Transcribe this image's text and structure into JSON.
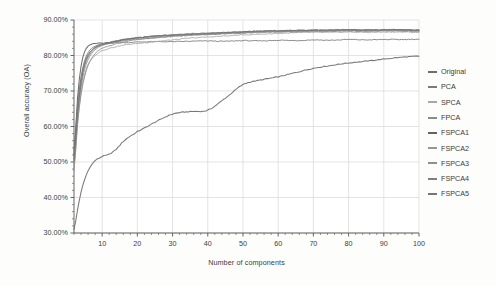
{
  "chart_data": {
    "type": "line",
    "title": "",
    "xlabel": "Number of components",
    "ylabel": "Overall accuracy (OA)",
    "xlim": [
      2,
      100
    ],
    "ylim": [
      30,
      90
    ],
    "xticks": [
      10,
      20,
      30,
      40,
      50,
      60,
      70,
      80,
      90,
      100
    ],
    "yticks": [
      30,
      40,
      50,
      60,
      70,
      80,
      90
    ],
    "ytick_labels": [
      "30.00%",
      "40.00%",
      "50.00%",
      "60.00%",
      "70.00%",
      "80.00%",
      "90.00%"
    ],
    "xtick_labels": [
      "10",
      "20",
      "30",
      "40",
      "50",
      "60",
      "70",
      "80",
      "90",
      "100"
    ],
    "grid": true,
    "legend_position": "right",
    "x": [
      2,
      3,
      4,
      5,
      6,
      7,
      8,
      9,
      10,
      12,
      14,
      16,
      18,
      20,
      25,
      30,
      35,
      40,
      45,
      50,
      55,
      60,
      65,
      70,
      75,
      80,
      85,
      90,
      95,
      100
    ],
    "series": [
      {
        "name": "Original",
        "color": "#6e6e6e",
        "values": [
          31.0,
          36.5,
          41.5,
          45.0,
          47.5,
          49.2,
          50.4,
          51.0,
          51.6,
          52.2,
          53.6,
          55.8,
          57.3,
          58.6,
          61.2,
          63.5,
          64.2,
          64.6,
          68.0,
          71.8,
          73.1,
          74.0,
          75.2,
          76.4,
          77.2,
          77.9,
          78.4,
          79.0,
          79.5,
          79.8
        ]
      },
      {
        "name": "PCA",
        "color": "#7a7a7a",
        "values": [
          53.5,
          66.0,
          74.0,
          78.5,
          80.8,
          82.0,
          82.6,
          83.0,
          83.2,
          83.4,
          83.6,
          83.6,
          83.7,
          83.8,
          83.9,
          83.9,
          84.0,
          84.1,
          84.0,
          84.2,
          84.1,
          84.3,
          84.2,
          84.4,
          84.3,
          84.5,
          84.4,
          84.5,
          84.5,
          84.6
        ]
      },
      {
        "name": "SPCA",
        "color": "#a8a8a8",
        "values": [
          48.0,
          61.0,
          69.5,
          74.5,
          77.5,
          79.0,
          80.0,
          80.8,
          81.4,
          82.0,
          82.5,
          82.9,
          83.2,
          83.4,
          83.9,
          84.4,
          84.9,
          85.2,
          85.5,
          85.8,
          86.0,
          86.2,
          86.4,
          86.5,
          86.5,
          86.6,
          86.5,
          86.6,
          86.6,
          86.5
        ]
      },
      {
        "name": "FPCA",
        "color": "#8a8a8a",
        "values": [
          50.0,
          64.0,
          72.5,
          77.0,
          79.5,
          81.0,
          82.0,
          82.6,
          83.0,
          83.4,
          83.8,
          84.1,
          84.4,
          84.6,
          85.0,
          85.4,
          85.7,
          85.9,
          86.1,
          86.3,
          86.5,
          86.6,
          86.7,
          86.8,
          86.8,
          86.9,
          86.8,
          86.9,
          86.9,
          86.8
        ]
      },
      {
        "name": "FSPCA1",
        "color": "#636363",
        "values": [
          52.0,
          68.0,
          77.0,
          81.0,
          82.6,
          83.2,
          83.4,
          83.5,
          83.5,
          83.6,
          84.0,
          84.4,
          84.7,
          85.0,
          85.4,
          85.7,
          85.9,
          86.2,
          86.4,
          86.6,
          86.8,
          86.9,
          87.0,
          87.1,
          87.1,
          87.2,
          87.1,
          87.2,
          87.2,
          87.1
        ]
      },
      {
        "name": "FSPCA2",
        "color": "#969696",
        "values": [
          49.0,
          62.5,
          71.0,
          76.0,
          78.8,
          80.5,
          81.6,
          82.3,
          82.8,
          83.3,
          83.8,
          84.2,
          84.5,
          84.8,
          85.3,
          85.6,
          85.9,
          86.1,
          86.3,
          86.5,
          86.7,
          86.8,
          86.9,
          87.0,
          87.0,
          87.1,
          87.0,
          87.1,
          87.1,
          87.0
        ]
      },
      {
        "name": "FSPCA3",
        "color": "#8f8f8f",
        "values": [
          47.5,
          60.5,
          69.0,
          74.0,
          77.2,
          79.2,
          80.5,
          81.4,
          82.0,
          82.7,
          83.3,
          83.8,
          84.2,
          84.5,
          85.0,
          85.4,
          85.7,
          86.0,
          86.2,
          86.4,
          86.6,
          86.7,
          86.8,
          86.9,
          86.9,
          87.0,
          86.9,
          87.0,
          87.0,
          86.9
        ]
      },
      {
        "name": "FSPCA4",
        "color": "#7f7f7f",
        "values": [
          51.0,
          65.0,
          73.5,
          78.0,
          80.2,
          81.5,
          82.3,
          82.8,
          83.2,
          83.7,
          84.1,
          84.5,
          84.8,
          85.0,
          85.4,
          85.8,
          86.0,
          86.2,
          86.4,
          86.6,
          86.8,
          86.9,
          87.0,
          87.1,
          87.1,
          87.2,
          87.1,
          87.2,
          87.2,
          87.1
        ]
      },
      {
        "name": "FSPCA5",
        "color": "#747474",
        "values": [
          50.5,
          63.5,
          72.0,
          77.5,
          80.0,
          81.4,
          82.2,
          82.7,
          83.1,
          83.6,
          84.0,
          84.4,
          84.7,
          85.0,
          85.5,
          85.8,
          86.1,
          86.3,
          86.5,
          86.7,
          86.9,
          87.0,
          87.1,
          87.2,
          87.2,
          87.3,
          87.2,
          87.3,
          87.3,
          87.2
        ]
      }
    ]
  },
  "legend": {
    "items": [
      {
        "label": "Original"
      },
      {
        "label": "PCA"
      },
      {
        "label": "SPCA"
      },
      {
        "label": "FPCA"
      },
      {
        "label": "FSPCA1"
      },
      {
        "label": "FSPCA2"
      },
      {
        "label": "FSPCA3"
      },
      {
        "label": "FSPCA4"
      },
      {
        "label": "FSPCA5"
      }
    ]
  },
  "axes": {
    "x_title": "Number of components",
    "y_title": "Overall accuracy (OA)"
  }
}
